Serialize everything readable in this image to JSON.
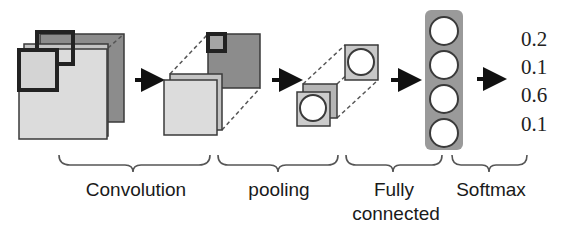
{
  "diagram": {
    "stages": [
      {
        "id": "convolution",
        "label": "Convolution"
      },
      {
        "id": "pooling",
        "label": "pooling"
      },
      {
        "id": "fully-connected",
        "label_line1": "Fully",
        "label_line2": "connected"
      },
      {
        "id": "softmax",
        "label": "Softmax"
      }
    ],
    "softmax_outputs": [
      "0.2",
      "0.1",
      "0.6",
      "0.1"
    ],
    "fc_nodes": 4,
    "colors": {
      "light_fill": "#d9d9d9",
      "mid_fill": "#bdbdbd",
      "dark_fill": "#8c8c8c",
      "outline": "#3a3a3a",
      "fc_column": "#9a9a9a",
      "text": "#1a1a1a"
    }
  }
}
